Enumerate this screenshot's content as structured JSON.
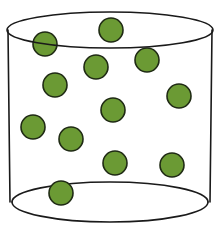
{
  "diagram": {
    "colors": {
      "particle_fill": "#6b9a34",
      "particle_stroke": "#1f2a14",
      "outline": "#1a1a1a",
      "background": "#ffffff"
    },
    "cylinder": {
      "top": {
        "cx": 110,
        "cy": 30,
        "rx": 103,
        "ry": 18
      },
      "bottom": {
        "cx": 110,
        "cy": 202,
        "rx": 98,
        "ry": 20
      },
      "left_x_top": 8,
      "left_x_bottom": 10,
      "right_x_top": 212,
      "right_x_bottom": 210
    },
    "particles": [
      {
        "cx": 45,
        "cy": 44,
        "r": 12
      },
      {
        "cx": 111,
        "cy": 30,
        "r": 12
      },
      {
        "cx": 96,
        "cy": 67,
        "r": 12
      },
      {
        "cx": 147,
        "cy": 60,
        "r": 12
      },
      {
        "cx": 55,
        "cy": 85,
        "r": 12
      },
      {
        "cx": 179,
        "cy": 96,
        "r": 12
      },
      {
        "cx": 113,
        "cy": 110,
        "r": 12
      },
      {
        "cx": 33,
        "cy": 127,
        "r": 12
      },
      {
        "cx": 71,
        "cy": 139,
        "r": 12
      },
      {
        "cx": 115,
        "cy": 163,
        "r": 12
      },
      {
        "cx": 172,
        "cy": 165,
        "r": 12
      },
      {
        "cx": 61,
        "cy": 193,
        "r": 12
      }
    ]
  }
}
